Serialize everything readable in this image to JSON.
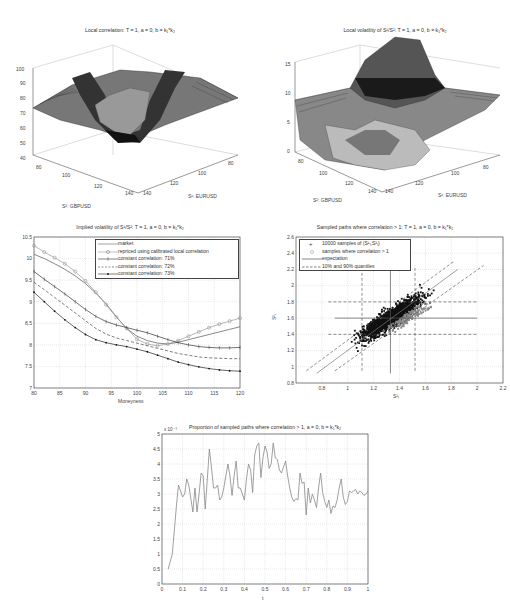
{
  "chart_data": [
    {
      "id": "local-correlation-surface",
      "type": "surface3d",
      "title": "Local correlation: T = 1, a = 0, b = k₁*k₂",
      "xlabel": "S²: GBPUSD",
      "ylabel": "S¹: EURUSD",
      "zlabel": "",
      "x_ticks": [
        80,
        100,
        120,
        140
      ],
      "y_ticks": [
        80,
        100,
        120,
        140
      ],
      "z_ticks": [
        40,
        50,
        60,
        70,
        80,
        90,
        100
      ],
      "zlim": [
        40,
        100
      ],
      "description": "Surface ~75-80 at edges, ridges ~97 near ATM, central trough ~52"
    },
    {
      "id": "local-volatility-surface",
      "type": "surface3d",
      "title": "Local volatility of S¹/S²: T = 1, a = 0, b = k₁*k₂",
      "xlabel": "S²: GBPUSD",
      "ylabel": "S¹: EURUSD",
      "x_ticks": [
        80,
        100,
        120,
        140
      ],
      "y_ticks": [
        80,
        100,
        120,
        140
      ],
      "z_ticks": [
        0,
        5,
        10,
        15
      ],
      "zlim": [
        0,
        15
      ],
      "description": "Plateau ~9 at edges, central peak ~17, trough near 0 along diagonal"
    },
    {
      "id": "implied-vol-smile",
      "type": "line",
      "title": "Implied volatility of S¹/S²: T = 1, a = 0, b = k₁*k₂",
      "xlabel": "Moneyness",
      "ylabel": "",
      "xlim": [
        80,
        120
      ],
      "ylim": [
        7,
        10.5
      ],
      "x_ticks": [
        80,
        85,
        90,
        95,
        100,
        105,
        110,
        115,
        120
      ],
      "y_ticks": [
        7,
        7.5,
        8,
        8.5,
        9,
        9.5,
        10,
        10.5
      ],
      "grid": true,
      "legend_position": "upper right",
      "x": [
        80,
        82,
        84,
        86,
        88,
        90,
        92,
        94,
        96,
        98,
        100,
        102,
        104,
        106,
        108,
        110,
        112,
        114,
        116,
        118,
        120
      ],
      "series": [
        {
          "name": "market",
          "style": "solid",
          "values": [
            10.1,
            10.0,
            9.88,
            9.75,
            9.6,
            9.42,
            9.2,
            8.95,
            8.65,
            8.38,
            8.2,
            8.1,
            8.04,
            8.02,
            8.06,
            8.12,
            8.18,
            8.24,
            8.3,
            8.36,
            8.42
          ]
        },
        {
          "name": "repriced using calibrated local correlation",
          "style": "circle",
          "values": [
            10.3,
            10.15,
            10.02,
            9.88,
            9.7,
            9.48,
            9.22,
            8.93,
            8.64,
            8.38,
            8.13,
            8.02,
            7.98,
            8.02,
            8.1,
            8.2,
            8.3,
            8.4,
            8.48,
            8.55,
            8.62
          ]
        },
        {
          "name": "constant correlation: 71%",
          "style": "plus",
          "values": [
            9.7,
            9.52,
            9.35,
            9.18,
            9.0,
            8.82,
            8.66,
            8.54,
            8.46,
            8.4,
            8.34,
            8.28,
            8.2,
            8.12,
            8.05,
            8.0,
            7.96,
            7.94,
            7.93,
            7.93,
            7.94
          ]
        },
        {
          "name": "constant correlation: 72%",
          "style": "dashed",
          "values": [
            9.45,
            9.28,
            9.1,
            8.92,
            8.74,
            8.56,
            8.38,
            8.25,
            8.16,
            8.1,
            8.04,
            7.98,
            7.92,
            7.86,
            7.8,
            7.76,
            7.72,
            7.7,
            7.69,
            7.68,
            7.68
          ]
        },
        {
          "name": "constant correlation: 73%",
          "style": "dot",
          "values": [
            9.22,
            9.0,
            8.78,
            8.58,
            8.4,
            8.24,
            8.12,
            8.05,
            8.0,
            7.96,
            7.9,
            7.84,
            7.76,
            7.68,
            7.6,
            7.54,
            7.49,
            7.45,
            7.42,
            7.4,
            7.39
          ]
        }
      ]
    },
    {
      "id": "sampled-paths-scatter",
      "type": "scatter",
      "title": "Sampled paths where correlation > 1: T = 1, a = 0, b = k₁*k₂",
      "xlabel": "S¹ₜ",
      "ylabel": "S²ₜ",
      "xlim": [
        0.6,
        2.2
      ],
      "ylim": [
        0.8,
        2.6
      ],
      "x_ticks": [
        0.8,
        1,
        1.2,
        1.4,
        1.6,
        1.8,
        2,
        2.2
      ],
      "y_ticks": [
        0.8,
        1,
        1.2,
        1.4,
        1.6,
        1.8,
        2,
        2.2,
        2.4,
        2.6
      ],
      "grid": true,
      "legend_position": "upper left",
      "series": [
        {
          "name": "10000 samples of (S¹ₜ,S²ₜ)",
          "marker": "+",
          "description": "dense cloud along diagonal, center ~(1.33,1.6)"
        },
        {
          "name": "samples where correlation > 1",
          "marker": "o",
          "description": "grey subset mainly at right edge of cloud x~1.3-1.65"
        },
        {
          "name": "expectation",
          "style": "solid",
          "x_value": 1.33,
          "y_value": 1.6
        },
        {
          "name": "10% and 90% quantiles",
          "style": "dashed",
          "x_values": [
            1.11,
            1.52
          ],
          "y_values": [
            1.4,
            1.8
          ]
        }
      ]
    },
    {
      "id": "proportion-over-time",
      "type": "line",
      "title": "Proportion of sampled paths where correlation > 1, a = 0, b = k₁*k₂",
      "xlabel": "t",
      "ylabel": "",
      "y_multiplier": "x 10⁻³",
      "xlim": [
        0,
        1
      ],
      "ylim": [
        0,
        5
      ],
      "x_ticks": [
        0,
        0.1,
        0.2,
        0.3,
        0.4,
        0.5,
        0.6,
        0.7,
        0.8,
        0.9,
        1
      ],
      "y_ticks": [
        0,
        0.5,
        1,
        1.5,
        2,
        2.5,
        3,
        3.5,
        4,
        4.5,
        5
      ],
      "grid": true,
      "x": [
        0.03,
        0.05,
        0.07,
        0.08,
        0.09,
        0.1,
        0.11,
        0.12,
        0.13,
        0.15,
        0.16,
        0.17,
        0.18,
        0.19,
        0.2,
        0.21,
        0.22,
        0.23,
        0.24,
        0.25,
        0.26,
        0.27,
        0.28,
        0.29,
        0.3,
        0.31,
        0.32,
        0.33,
        0.34,
        0.35,
        0.36,
        0.37,
        0.38,
        0.39,
        0.4,
        0.41,
        0.42,
        0.43,
        0.44,
        0.45,
        0.46,
        0.47,
        0.48,
        0.49,
        0.5,
        0.51,
        0.52,
        0.53,
        0.54,
        0.55,
        0.56,
        0.57,
        0.58,
        0.59,
        0.6,
        0.61,
        0.62,
        0.63,
        0.64,
        0.65,
        0.66,
        0.67,
        0.68,
        0.69,
        0.7,
        0.71,
        0.72,
        0.73,
        0.74,
        0.75,
        0.76,
        0.77,
        0.78,
        0.79,
        0.8,
        0.81,
        0.82,
        0.83,
        0.84,
        0.85,
        0.86,
        0.87,
        0.88,
        0.89,
        0.9,
        0.91,
        0.92,
        0.93,
        0.94,
        0.95,
        0.96,
        0.97,
        0.98,
        0.99,
        1.0
      ],
      "values": [
        0.5,
        1.0,
        2.6,
        3.3,
        3.1,
        2.9,
        3.0,
        3.5,
        3.3,
        2.4,
        3.2,
        2.4,
        3.0,
        3.7,
        3.6,
        2.5,
        3.5,
        4.5,
        3.9,
        3.2,
        3.2,
        3.3,
        2.8,
        2.9,
        3.2,
        3.6,
        4.0,
        3.6,
        2.95,
        3.6,
        4.1,
        3.2,
        3.2,
        3.0,
        2.8,
        3.5,
        4.0,
        3.8,
        3.05,
        4.3,
        4.6,
        4.7,
        3.55,
        4.2,
        4.6,
        4.4,
        3.85,
        4.0,
        4.7,
        4.2,
        4.15,
        3.8,
        3.7,
        3.9,
        4.1,
        3.6,
        3.2,
        2.9,
        2.75,
        2.85,
        2.8,
        3.7,
        3.35,
        3.4,
        2.3,
        3.2,
        2.7,
        3.0,
        2.8,
        2.55,
        3.2,
        3.7,
        3.05,
        2.75,
        2.55,
        2.8,
        2.35,
        2.6,
        2.55,
        2.8,
        3.2,
        3.5,
        2.9,
        2.65,
        2.75,
        3.1,
        3.05,
        3.1,
        3.15,
        3.0,
        3.1,
        3.05,
        2.95,
        3.0,
        3.1
      ]
    }
  ],
  "panels": {
    "corr3d": {
      "title": "Local correlation: T = 1, a = 0, b = k₁*k₂",
      "xlabel": "S²: GBPUSD",
      "ylabel": "S¹: EURUSD",
      "zticks": [
        "100",
        "90",
        "80",
        "70",
        "60",
        "50",
        "40"
      ],
      "xticks": [
        "80",
        "100",
        "120",
        "140"
      ],
      "yticks": [
        "140",
        "120",
        "100",
        "80"
      ]
    },
    "vol3d": {
      "title": "Local volatility of S¹/S²: T = 1, a = 0, b = k₁*k₂",
      "xlabel": "S²: GBPUSD",
      "ylabel": "S¹: EURUSD",
      "zticks": [
        "15",
        "10",
        "5",
        "0"
      ],
      "xticks": [
        "80",
        "100",
        "120",
        "140"
      ],
      "yticks": [
        "140",
        "120",
        "100",
        "80"
      ]
    },
    "smile": {
      "title": "Implied volatility of S¹/S²: T = 1, a = 0, b = k₁*k₂",
      "xlabel": "Moneyness",
      "legend": [
        "market",
        "repriced using calibrated local correlation",
        "constant correlation: 71%",
        "constant correlation: 72%",
        "constant correlation: 73%"
      ]
    },
    "scatter": {
      "title": "Sampled paths where correlation > 1: T = 1, a = 0, b = k₁*k₂",
      "xlabel": "S¹ₜ",
      "ylabel": "S²ₜ",
      "legend": [
        "10000 samples of (S¹ₜ,S²ₜ)",
        "samples where correlation > 1",
        "expectation",
        "10% and 90% quantiles"
      ]
    },
    "prop": {
      "title": "Proportion of sampled paths where correlation > 1, a = 0, b = k₁*k₂",
      "xlabel": "t",
      "multiplier": "x 10⁻³"
    }
  },
  "colors": {
    "axis": "#333333",
    "grid": "#c8c8c8",
    "line_dark": "#333333",
    "line_grey": "#888888",
    "surface_dark": "#1a1a1a",
    "surface_light": "#d8d8d8"
  }
}
